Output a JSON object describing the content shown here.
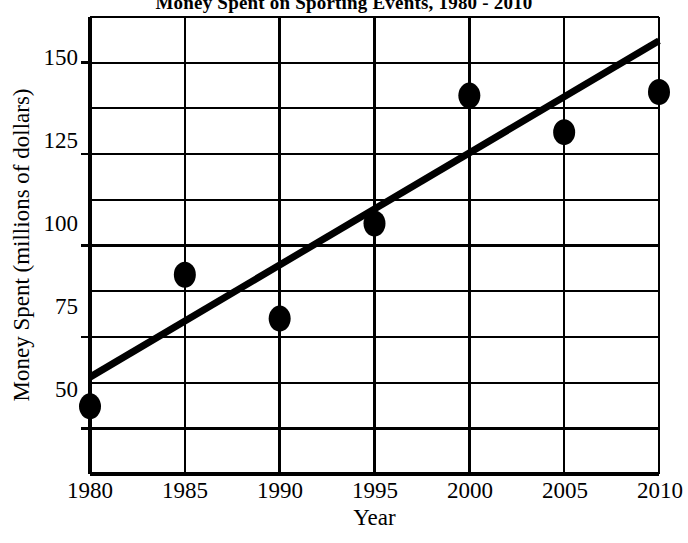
{
  "chart_data": {
    "type": "scatter",
    "title": "Money Spent on Sporting Events, 1980 - 2010",
    "xlabel": "Year",
    "ylabel": "Money Spent (millions of dollars)",
    "xlim": [
      1980,
      2010
    ],
    "ylim": [
      37.5,
      162.5
    ],
    "grid": true,
    "legend": null,
    "x_ticks": [
      1980,
      1985,
      1990,
      1995,
      2000,
      2005,
      2010
    ],
    "x_tick_labels": [
      "1980",
      "1985",
      "1990",
      "1995",
      "2000",
      "2005",
      "2010"
    ],
    "y_ticks": [
      50,
      75,
      100,
      125,
      150
    ],
    "y_tick_labels": [
      "50",
      "75",
      "100",
      "125",
      "150"
    ],
    "y_gridlines": [
      50,
      62.5,
      75,
      87.5,
      100,
      112.5,
      125,
      137.5,
      150,
      162.5
    ],
    "x_gridlines": [
      1980,
      1985,
      1990,
      1995,
      2000,
      2005,
      2010
    ],
    "x": [
      1980,
      1985,
      1990,
      1995,
      2000,
      2005,
      2010
    ],
    "values": [
      56,
      92,
      80,
      106,
      141,
      131,
      142
    ],
    "series": [
      {
        "name": "Money Spent",
        "marker": "filled-ellipse",
        "color": "#000000",
        "points": [
          {
            "x": 1980,
            "y": 56
          },
          {
            "x": 1985,
            "y": 92
          },
          {
            "x": 1990,
            "y": 80
          },
          {
            "x": 1995,
            "y": 106
          },
          {
            "x": 2000,
            "y": 141
          },
          {
            "x": 2005,
            "y": 131
          },
          {
            "x": 2010,
            "y": 142
          }
        ]
      }
    ],
    "trend_line": {
      "name": "line of best fit",
      "color": "#000000",
      "start": {
        "x": 1980,
        "y": 64
      },
      "end": {
        "x": 2010,
        "y": 156
      }
    },
    "colors": {
      "marker": "#000000",
      "trend_line": "#000000",
      "axis": "#000000",
      "grid": "#000000",
      "background": "#ffffff"
    }
  }
}
